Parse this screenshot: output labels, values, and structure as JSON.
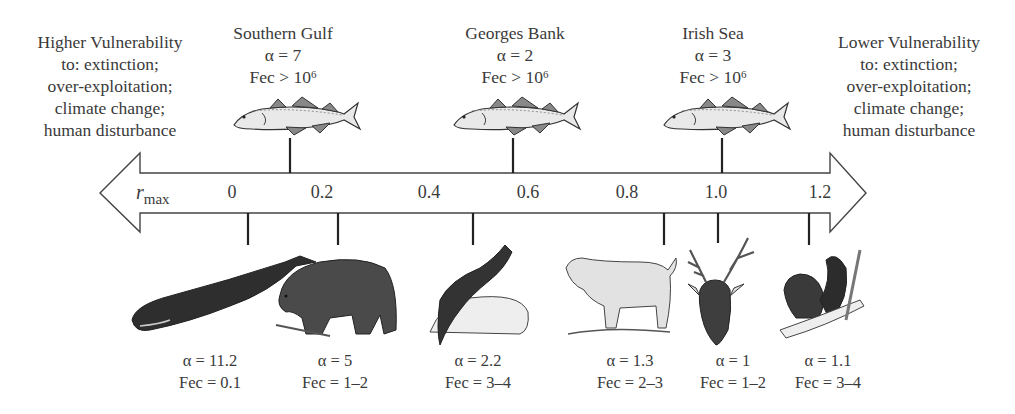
{
  "left_note": {
    "title": "Higher Vulnerability",
    "lines": [
      "to: extinction;",
      "over-exploitation;",
      "climate change;",
      "human disturbance"
    ]
  },
  "right_note": {
    "title": "Lower Vulnerability",
    "lines": [
      "to: extinction;",
      "over-exploitation;",
      "climate change;",
      "human disturbance"
    ]
  },
  "axis": {
    "label_main": "r",
    "label_sub": "max",
    "ticks": [
      {
        "label": "0",
        "x": 232
      },
      {
        "label": "0.2",
        "x": 322
      },
      {
        "label": "0.4",
        "x": 429
      },
      {
        "label": "0.6",
        "x": 528
      },
      {
        "label": "0.8",
        "x": 627
      },
      {
        "label": "1.0",
        "x": 716
      },
      {
        "label": "1.2",
        "x": 820
      }
    ]
  },
  "cod_populations": [
    {
      "name": "Southern Gulf",
      "alpha": "α = 7",
      "fec_prefix": "Fec > 10",
      "fec_exp": "6",
      "x": 290,
      "icon": "cod-fish-icon"
    },
    {
      "name": "Georges Bank",
      "alpha": "α = 2",
      "fec_prefix": "Fec > 10",
      "fec_exp": "6",
      "x": 513,
      "icon": "cod-fish-icon"
    },
    {
      "name": "Irish Sea",
      "alpha": "α = 3",
      "fec_prefix": "Fec > 10",
      "fec_exp": "6",
      "x": 722,
      "icon": "cod-fish-icon"
    }
  ],
  "mammals": [
    {
      "species": "sperm whale",
      "icon": "whale-icon",
      "alpha": "α = 11.2",
      "fec": "Fec = 0.1",
      "tick_x": 248,
      "label_x": 210
    },
    {
      "species": "black bear",
      "icon": "bear-icon",
      "alpha": "α = 5",
      "fec": "Fec = 1–2",
      "tick_x": 338,
      "label_x": 335
    },
    {
      "species": "otter",
      "icon": "otter-icon",
      "alpha": "α = 2.2",
      "fec": "Fec = 3–4",
      "tick_x": 473,
      "label_x": 478
    },
    {
      "species": "bobcat",
      "icon": "bobcat-icon",
      "alpha": "α = 1.3",
      "fec": "Fec = 2–3",
      "tick_x": 664,
      "label_x": 630
    },
    {
      "species": "white-tailed deer",
      "icon": "deer-icon",
      "alpha": "α = 1",
      "fec": "Fec = 1–2",
      "tick_x": 718,
      "label_x": 732
    },
    {
      "species": "squirrel",
      "icon": "squirrel-icon",
      "alpha": "α = 1.1",
      "fec": "Fec = 3–4",
      "tick_x": 809,
      "label_x": 825
    }
  ]
}
